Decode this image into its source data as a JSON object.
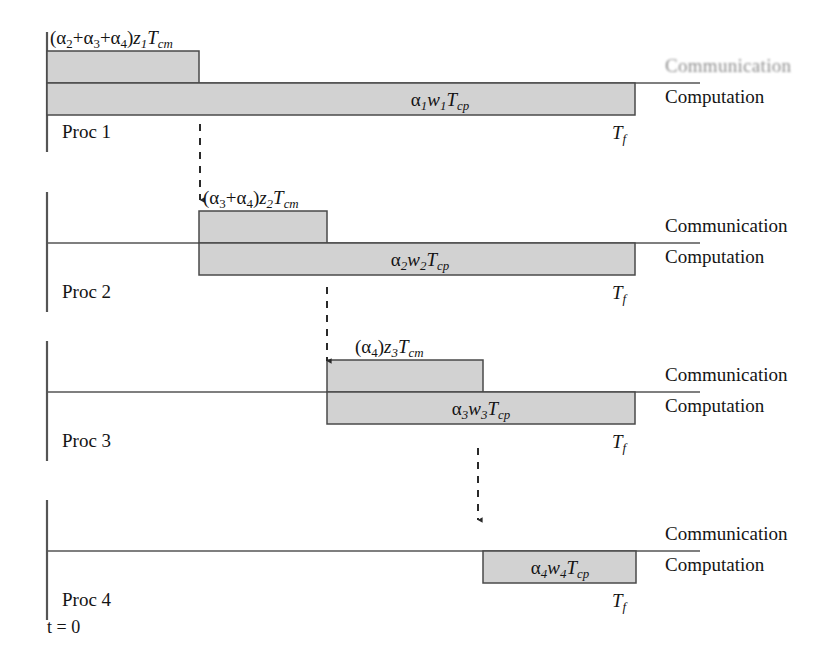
{
  "figure": {
    "type": "timing-diagram",
    "title": "",
    "background_color": "#ffffff",
    "bar_fill_color": "#d2d2d2",
    "bar_stroke_color": "#4a4a4a",
    "axis_color": "#555555",
    "text_color": "#141414",
    "time_origin_label": "t = 0",
    "finish_time_label": "T",
    "finish_time_sub": "f"
  },
  "legend": {
    "communication_label": "Communication",
    "computation_label": "Computation"
  },
  "rows": [
    {
      "name": "Proc 1",
      "proc_label": "Proc 1",
      "side_labels": {
        "communication": "Communication",
        "computation": "Computation",
        "communication_degraded": true
      },
      "finish_label": "T",
      "finish_sub": "f",
      "comm_bar": {
        "caption_plain": "(α₂+α₃+α₄)z₁Tₐₘ",
        "alpha_terms": [
          "2",
          "3",
          "4"
        ],
        "z_index": "1",
        "t_sub": "cm",
        "start_px": 47,
        "end_px": 199
      },
      "comp_bar": {
        "caption_plain": "α₁w₁Tₚₚ",
        "alpha_index": "1",
        "w_index": "1",
        "t_sub": "cp",
        "start_px": 47,
        "end_px": 635
      }
    },
    {
      "name": "Proc 2",
      "proc_label": "Proc 2",
      "side_labels": {
        "communication": "Communication",
        "computation": "Computation",
        "communication_degraded": false
      },
      "finish_label": "T",
      "finish_sub": "f",
      "comm_bar": {
        "caption_plain": "(α₃+α₄)z₂Tₐₘ",
        "alpha_terms": [
          "3",
          "4"
        ],
        "z_index": "2",
        "t_sub": "cm",
        "start_px": 199,
        "end_px": 327
      },
      "comp_bar": {
        "caption_plain": "α₂w₂Tₚₚ",
        "alpha_index": "2",
        "w_index": "2",
        "t_sub": "cp",
        "start_px": 199,
        "end_px": 635
      }
    },
    {
      "name": "Proc 3",
      "proc_label": "Proc 3",
      "side_labels": {
        "communication": "Communication",
        "computation": "Computation",
        "communication_degraded": false
      },
      "finish_label": "T",
      "finish_sub": "f",
      "comm_bar": {
        "caption_plain": "(α₄)z₃Tₐₘ",
        "alpha_terms": [
          "4"
        ],
        "z_index": "3",
        "t_sub": "cm",
        "start_px": 327,
        "end_px": 483
      },
      "comp_bar": {
        "caption_plain": "α₃w₃Tₚₚ",
        "alpha_index": "3",
        "w_index": "3",
        "t_sub": "cp",
        "start_px": 327,
        "end_px": 635
      }
    },
    {
      "name": "Proc 4",
      "proc_label": "Proc 4",
      "side_labels": {
        "communication": "Communication",
        "computation": "Computation",
        "communication_degraded": false
      },
      "finish_label": "T",
      "finish_sub": "f",
      "comm_bar": null,
      "comp_bar": {
        "caption_plain": "α₄w₄Tₚₚ",
        "alpha_index": "4",
        "w_index": "4",
        "t_sub": "cp",
        "start_px": 483,
        "end_px": 636
      }
    }
  ],
  "arrows": [
    {
      "from_row": 1,
      "to_row": 2,
      "x_px": 200,
      "y_start_px": 124,
      "y_end_px": 202
    },
    {
      "from_row": 2,
      "to_row": 3,
      "x_px": 327,
      "y_start_px": 287,
      "y_end_px": 363
    },
    {
      "from_row": 3,
      "to_row": 4,
      "x_px": 478,
      "y_start_px": 448,
      "y_end_px": 522
    }
  ]
}
